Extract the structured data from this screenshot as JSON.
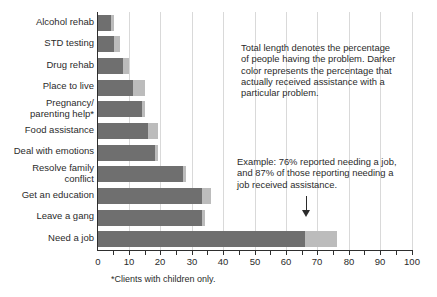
{
  "colors": {
    "bar_dark": "#6f6f6f",
    "bar_light": "#bcbcbc",
    "gridline": "#d9d9d9",
    "axis": "#2e2e2e",
    "text": "#2b2b2b"
  },
  "chart_data": {
    "type": "bar",
    "orientation": "horizontal",
    "title": "",
    "xlabel": "",
    "ylabel": "",
    "xlim": [
      0,
      100
    ],
    "x_ticks": [
      0,
      10,
      20,
      30,
      40,
      50,
      60,
      70,
      80,
      90,
      100
    ],
    "minor_tick_step": 5,
    "grid": "vertical, light gray, at every 10",
    "legend": "none (explained by annotations)",
    "categories": [
      "Alcohol rehab",
      "STD testing",
      "Drug rehab",
      "Place to live",
      "Pregnancy/\nparenting help*",
      "Food assistance",
      "Deal with emotions",
      "Resolve family\nconflict",
      "Get an education",
      "Leave a gang",
      "Need a job"
    ],
    "series": [
      {
        "name": "Received assistance (dark segment, % of all clients)",
        "values": [
          4,
          5,
          8,
          11,
          14,
          16,
          18,
          27,
          33,
          33,
          66
        ]
      },
      {
        "name": "Reported having the problem (total bar length, %)",
        "values": [
          5,
          7,
          10,
          15,
          15,
          19,
          19,
          28,
          36,
          34,
          76
        ]
      }
    ]
  },
  "annotations": {
    "explanation": "Total length denotes the percentage\nof people having the problem. Darker\ncolor represents the percentage that\nactually received assistance with a\nparticular problem.",
    "example": "Example: 76% reported needing a job,\nand 87% of those reporting needing a\njob received assistance."
  },
  "footnote": "*Clients with children only."
}
